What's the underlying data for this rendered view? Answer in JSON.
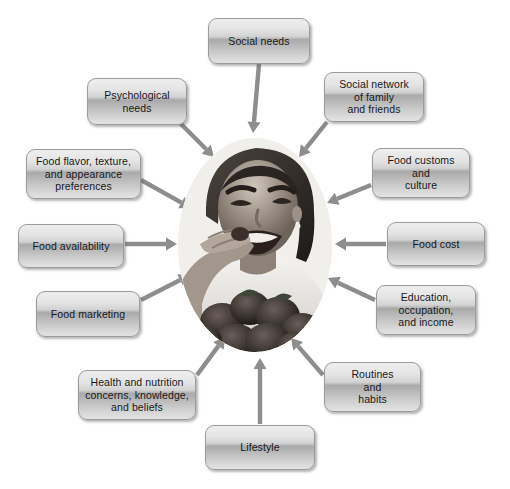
{
  "diagram": {
    "canvas": {
      "width": 510,
      "height": 489,
      "background": "#ffffff"
    },
    "center": {
      "name": "center-photo",
      "description": "Grayscale oval photograph of a smiling woman eating a berry, with a bowl of strawberries",
      "shape": "ellipse",
      "x": 178,
      "y": 138,
      "width": 154,
      "height": 214
    },
    "arrow_color": "#8d8d8d",
    "node_border_color": "#9b9b9b",
    "node_text_color": "#16181c",
    "nodes": [
      {
        "id": "social-needs",
        "label": "Social needs",
        "x": 208,
        "y": 18,
        "w": 102,
        "h": 46
      },
      {
        "id": "social-network",
        "label": "Social network\nof family\nand friends",
        "x": 324,
        "y": 72,
        "w": 100,
        "h": 50
      },
      {
        "id": "psychological-needs",
        "label": "Psychological\nneeds",
        "x": 87,
        "y": 78,
        "w": 100,
        "h": 47
      },
      {
        "id": "food-customs",
        "label": "Food customs\nand\nculture",
        "x": 372,
        "y": 148,
        "w": 98,
        "h": 50
      },
      {
        "id": "food-flavor",
        "label": "Food flavor, texture,\nand appearance\npreferences",
        "x": 26,
        "y": 149,
        "w": 115,
        "h": 50
      },
      {
        "id": "food-cost",
        "label": "Food cost",
        "x": 387,
        "y": 222,
        "w": 98,
        "h": 44
      },
      {
        "id": "food-availability",
        "label": "Food availability",
        "x": 18,
        "y": 224,
        "w": 106,
        "h": 44
      },
      {
        "id": "education",
        "label": "Education,\noccupation,\nand income",
        "x": 376,
        "y": 285,
        "w": 100,
        "h": 50
      },
      {
        "id": "food-marketing",
        "label": "Food marketing",
        "x": 36,
        "y": 291,
        "w": 104,
        "h": 46
      },
      {
        "id": "routines",
        "label": "Routines\nand\nhabits",
        "x": 324,
        "y": 362,
        "w": 97,
        "h": 50
      },
      {
        "id": "health-nutrition",
        "label": "Health and nutrition\nconcerns, knowledge,\nand beliefs",
        "x": 78,
        "y": 370,
        "w": 118,
        "h": 50
      },
      {
        "id": "lifestyle",
        "label": "Lifestyle",
        "x": 205,
        "y": 425,
        "w": 110,
        "h": 45
      }
    ],
    "arrows": [
      {
        "from": "social-needs",
        "x1": 259,
        "y1": 64,
        "x2": 253,
        "y2": 133
      },
      {
        "from": "social-network",
        "x1": 327,
        "y1": 122,
        "x2": 299,
        "y2": 157
      },
      {
        "from": "psychological-needs",
        "x1": 178,
        "y1": 121,
        "x2": 214,
        "y2": 157
      },
      {
        "from": "food-customs",
        "x1": 371,
        "y1": 185,
        "x2": 327,
        "y2": 203
      },
      {
        "from": "food-flavor",
        "x1": 141,
        "y1": 180,
        "x2": 191,
        "y2": 208
      },
      {
        "from": "food-cost",
        "x1": 386,
        "y1": 244,
        "x2": 335,
        "y2": 244
      },
      {
        "from": "food-availability",
        "x1": 125,
        "y1": 244,
        "x2": 177,
        "y2": 244
      },
      {
        "from": "education",
        "x1": 375,
        "y1": 300,
        "x2": 328,
        "y2": 278
      },
      {
        "from": "food-marketing",
        "x1": 141,
        "y1": 300,
        "x2": 190,
        "y2": 275
      },
      {
        "from": "routines",
        "x1": 323,
        "y1": 375,
        "x2": 291,
        "y2": 338
      },
      {
        "from": "health-nutrition",
        "x1": 197,
        "y1": 375,
        "x2": 225,
        "y2": 337
      },
      {
        "from": "lifestyle",
        "x1": 260,
        "y1": 424,
        "x2": 260,
        "y2": 358
      }
    ]
  }
}
